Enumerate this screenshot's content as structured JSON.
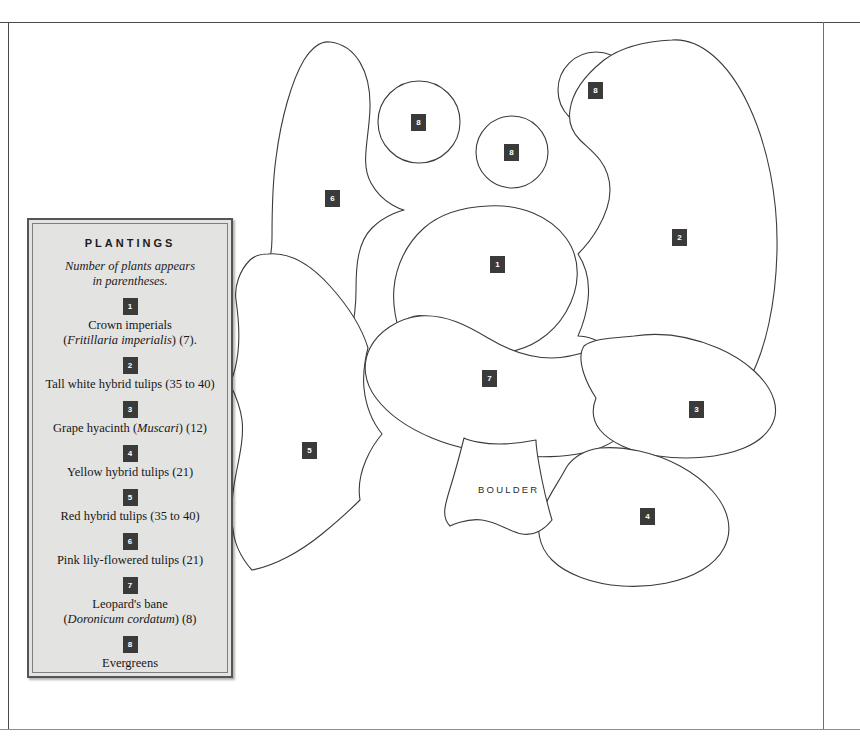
{
  "legend": {
    "title": "PLANTINGS",
    "subtitle_line1": "Number of plants appears",
    "subtitle_line2": "in parentheses.",
    "entries": [
      {
        "number": "1",
        "line1_plain": "Crown imperials",
        "line2_italic": "Fritillaria imperialis",
        "line2_plain_before": "(",
        "line2_plain_after": ") (7)."
      },
      {
        "number": "2",
        "line1_plain": "Tall white hybrid tulips (35 to 40)",
        "line2_italic": "",
        "line2_plain_before": "",
        "line2_plain_after": ""
      },
      {
        "number": "3",
        "line1_plain": "Grape hyacinth (",
        "line1_italic": "Muscari",
        "line1_plain_after": ") (12)"
      },
      {
        "number": "4",
        "line1_plain": "Yellow hybrid tulips (21)"
      },
      {
        "number": "5",
        "line1_plain": "Red hybrid tulips (35 to 40)"
      },
      {
        "number": "6",
        "line1_plain": "Pink lily-flowered tulips (21)"
      },
      {
        "number": "7",
        "line1_plain": "Leopard's bane",
        "line2_italic": "Doronicum cordatum",
        "line2_plain_before": "(",
        "line2_plain_after": ") (8)"
      },
      {
        "number": "8",
        "line1_plain": "Evergreens"
      }
    ]
  },
  "map": {
    "boulder_label": "BOULDER",
    "badges": [
      {
        "number": "6",
        "x": 325,
        "y": 190,
        "bed": "pink-lily-flowered-tulips"
      },
      {
        "number": "8",
        "x": 411,
        "y": 114,
        "bed": "evergreen-circle-left"
      },
      {
        "number": "8",
        "x": 504,
        "y": 144,
        "bed": "evergreen-circle-middle"
      },
      {
        "number": "8",
        "x": 588,
        "y": 82,
        "bed": "evergreen-circle-right"
      },
      {
        "number": "2",
        "x": 672,
        "y": 229,
        "bed": "tall-white-hybrid-tulips"
      },
      {
        "number": "1",
        "x": 490,
        "y": 256,
        "bed": "crown-imperials"
      },
      {
        "number": "7",
        "x": 482,
        "y": 370,
        "bed": "leopards-bane"
      },
      {
        "number": "3",
        "x": 689,
        "y": 401,
        "bed": "grape-hyacinth"
      },
      {
        "number": "5",
        "x": 302,
        "y": 442,
        "bed": "red-hybrid-tulips"
      },
      {
        "number": "4",
        "x": 640,
        "y": 508,
        "bed": "yellow-hybrid-tulips"
      }
    ]
  },
  "colors": {
    "badge_background": "#3a3a3a",
    "badge_text": "#ffffff",
    "legend_background": "#e3e3e1",
    "legend_border": "#555553",
    "bed_outline": "#3b3b3b",
    "page_rule": "#4a4a4a"
  }
}
